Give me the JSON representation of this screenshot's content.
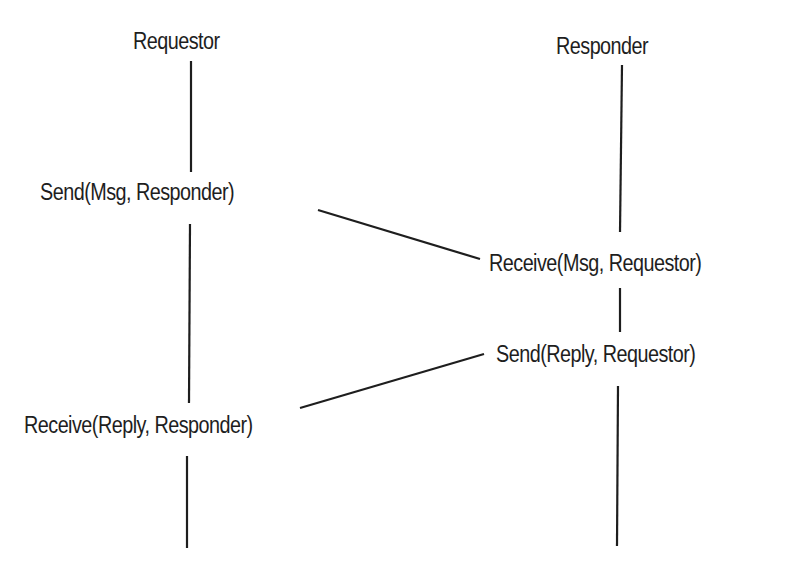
{
  "diagram": {
    "type": "sequence",
    "participants": [
      {
        "id": "requestor",
        "label": "Requestor"
      },
      {
        "id": "responder",
        "label": "Responder"
      }
    ],
    "events": [
      {
        "participant": "requestor",
        "label": "Send(Msg, Responder)"
      },
      {
        "participant": "responder",
        "label": "Receive(Msg, Requestor)"
      },
      {
        "participant": "responder",
        "label": "Send(Reply, Requestor)"
      },
      {
        "participant": "requestor",
        "label": "Receive(Reply, Responder)"
      }
    ],
    "messages": [
      {
        "from": "requestor",
        "to": "responder",
        "from_event": "Send(Msg, Responder)",
        "to_event": "Receive(Msg, Requestor)"
      },
      {
        "from": "responder",
        "to": "requestor",
        "from_event": "Send(Reply, Requestor)",
        "to_event": "Receive(Reply, Responder)"
      }
    ],
    "colors": {
      "line": "#1e1e1e",
      "text": "#1e1e1e",
      "background": "#ffffff"
    }
  }
}
